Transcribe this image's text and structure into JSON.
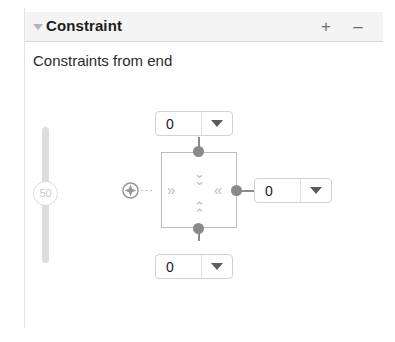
{
  "panel": {
    "header": {
      "title": "Constraint",
      "disclosure_icon": "disclosure-triangle-down-icon",
      "add_label": "+",
      "remove_label": "–"
    },
    "subtitle": "Constraints from end"
  },
  "slider": {
    "value": "50",
    "orientation": "vertical"
  },
  "constraint_editor": {
    "move_handle_icon": "move-plus-circle-icon",
    "dotted_connector": "···",
    "inner_arrows": {
      "top": "⌄⌄",
      "bottom": "⌃⌃",
      "left": "»",
      "right": "«"
    },
    "fields": {
      "top": {
        "value": "0",
        "caret_icon": "chevron-down-icon"
      },
      "bottom": {
        "value": "0",
        "caret_icon": "chevron-down-icon"
      },
      "right": {
        "value": "0",
        "caret_icon": "chevron-down-icon"
      }
    }
  },
  "colors": {
    "header_bg": "#f4f4f4",
    "border": "#d2d2d2",
    "nub": "#8a8a8a",
    "arrow": "#bcbcbc",
    "text": "#1c1c1c",
    "slider_track": "#dddddd"
  }
}
